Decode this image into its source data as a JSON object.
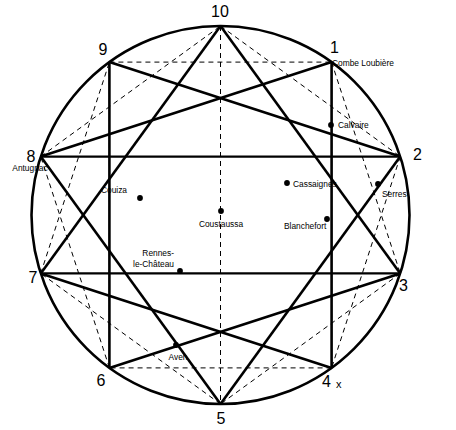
{
  "figure": {
    "type": "geometric-star-diagram",
    "colors": {
      "ink": "#000000",
      "paper": "#ffffff"
    },
    "circle": {
      "cx": 220.5,
      "cy": 215,
      "r": 189
    },
    "vertex_count": 10,
    "solid_star_step": 3,
    "dashed_star_step": 2,
    "extra_mark": "x"
  },
  "vertices": [
    {
      "id": 1,
      "label": "1",
      "angle_deg": -54,
      "lx": 330,
      "ly": 53,
      "anchor": "start"
    },
    {
      "id": 2,
      "label": "2",
      "angle_deg": -18,
      "lx": 413,
      "ly": 160,
      "anchor": "start"
    },
    {
      "id": 3,
      "label": "3",
      "angle_deg": 18,
      "lx": 399,
      "ly": 291,
      "anchor": "start"
    },
    {
      "id": 4,
      "label": "4",
      "angle_deg": 54,
      "lx": 322,
      "ly": 387,
      "anchor": "start"
    },
    {
      "id": 5,
      "label": "5",
      "angle_deg": 90,
      "lx": 221,
      "ly": 424,
      "anchor": "middle"
    },
    {
      "id": 6,
      "label": "6",
      "angle_deg": 126,
      "lx": 101,
      "ly": 386,
      "anchor": "middle"
    },
    {
      "id": 7,
      "label": "7",
      "angle_deg": 162,
      "lx": 33,
      "ly": 283,
      "anchor": "middle"
    },
    {
      "id": 8,
      "label": "8",
      "angle_deg": -162,
      "lx": 31,
      "ly": 162,
      "anchor": "middle"
    },
    {
      "id": 9,
      "label": "9",
      "angle_deg": -126,
      "lx": 103,
      "ly": 55,
      "anchor": "middle"
    },
    {
      "id": 10,
      "label": "10",
      "angle_deg": -90,
      "lx": 220,
      "ly": 17,
      "anchor": "middle"
    }
  ],
  "sites": [
    {
      "name": "Combe Loubiere",
      "label": "Combe Loubière",
      "dot": false,
      "dx": 331,
      "dy": 57,
      "lx": 332,
      "ly": 66,
      "anchor": "start",
      "lines": [
        "Combe Loubière"
      ]
    },
    {
      "name": "Calvaire",
      "label": "Calvaire",
      "dot": true,
      "dx": 331,
      "dy": 125,
      "lx": 338,
      "ly": 128,
      "anchor": "start",
      "lines": [
        "Calvaire"
      ]
    },
    {
      "name": "Antugnac",
      "label": "Antugnac",
      "dot": false,
      "dx": 41,
      "dy": 157,
      "lx": 30,
      "ly": 171,
      "anchor": "middle",
      "lines": [
        "Antugnac"
      ]
    },
    {
      "name": "Cassaignes",
      "label": "Cassaignes",
      "dot": true,
      "dx": 287,
      "dy": 183,
      "lx": 293,
      "ly": 187,
      "anchor": "start",
      "lines": [
        "Cassaignes"
      ]
    },
    {
      "name": "Serres",
      "label": "Serres",
      "dot": true,
      "dx": 378,
      "dy": 184,
      "lx": 382,
      "ly": 197,
      "anchor": "start",
      "lines": [
        "Serres"
      ]
    },
    {
      "name": "Couiza",
      "label": "Couiza",
      "dot": true,
      "dx": 140,
      "dy": 198,
      "lx": 114,
      "ly": 193,
      "anchor": "middle",
      "lines": [
        "Couiza"
      ]
    },
    {
      "name": "Coustaussa",
      "label": "Coustaussa",
      "dot": true,
      "dx": 221,
      "dy": 211,
      "lx": 221,
      "ly": 227,
      "anchor": "middle",
      "lines": [
        "Coustaussa"
      ]
    },
    {
      "name": "Blanchefort",
      "label": "Blanchefort",
      "dot": true,
      "dx": 327,
      "dy": 219,
      "lx": 284,
      "ly": 229,
      "anchor": "start",
      "lines": [
        "Blanchefort"
      ]
    },
    {
      "name": "Rennes-le-Chateau",
      "label": "Rennes-le-Château",
      "dot": true,
      "dx": 180,
      "dy": 271,
      "lx": 174,
      "ly": 256,
      "anchor": "end",
      "lines": [
        "Rennes-",
        "le-Château"
      ]
    },
    {
      "name": "Aven",
      "label": "Aven",
      "dot": true,
      "dx": 176,
      "dy": 345,
      "lx": 178,
      "ly": 360,
      "anchor": "middle",
      "lines": [
        "Aven"
      ]
    }
  ],
  "markers": [
    {
      "name": "x-mark",
      "text": "x",
      "x": 336,
      "y": 388
    }
  ]
}
